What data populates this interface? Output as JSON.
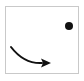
{
  "panel": {
    "title": "Arrow and dot diagram",
    "background_color": "#ffffff",
    "border_color": "#c9c9c9",
    "border_width_px": 1,
    "x": 5,
    "y": 6,
    "width": 74,
    "height": 68
  },
  "page": {
    "background_color": "#ffffff",
    "width": 84,
    "height": 81
  },
  "shapes": {
    "dot": {
      "name": "target-dot",
      "label": "dot",
      "color": "#111111",
      "center_x": 63,
      "center_y": 19,
      "radius": 4
    },
    "arrow": {
      "name": "curved-arrow",
      "label": "curved arrow pointing right",
      "color": "#111111",
      "stroke_width": 2,
      "start_x": 5,
      "start_y": 40,
      "control_x": 18,
      "control_y": 57,
      "end_x": 36,
      "end_y": 56,
      "head_tip_x": 45,
      "head_tip_y": 56,
      "head_width": 10,
      "head_height": 9
    }
  },
  "chart_data": {
    "type": "scatter",
    "title": "Arrow and dot diagram",
    "xlabel": "",
    "ylabel": "",
    "categories": [
      "dot",
      "arrow"
    ],
    "values": [
      1,
      1
    ],
    "annotations": [
      "black filled dot located in the upper-right region",
      "black curved arrow sweeping from upper-left downward to the right, arrowhead pointing right, in the lower-left region"
    ]
  }
}
